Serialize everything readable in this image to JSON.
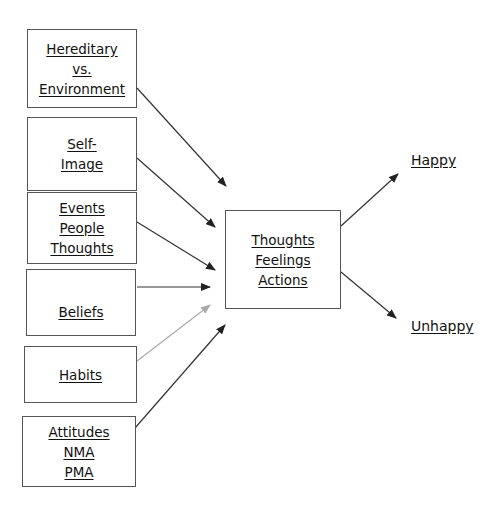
{
  "diagram": {
    "inputs": [
      {
        "id": "hereditary",
        "lines": [
          "Hereditary",
          "vs.",
          "Environment"
        ]
      },
      {
        "id": "self-image",
        "lines": [
          "Self-",
          "Image"
        ]
      },
      {
        "id": "events",
        "lines": [
          "Events",
          "People",
          "Thoughts"
        ]
      },
      {
        "id": "beliefs",
        "lines": [
          "Beliefs"
        ]
      },
      {
        "id": "habits",
        "lines": [
          "Habits"
        ]
      },
      {
        "id": "attitudes",
        "lines": [
          "Attitudes",
          "NMA",
          "PMA"
        ]
      }
    ],
    "center": {
      "lines": [
        "Thoughts",
        "Feelings",
        "Actions"
      ]
    },
    "outcomes": {
      "happy": "Happy",
      "unhappy": "Unhappy"
    },
    "colors": {
      "arrow": "#222222",
      "arrow_light": "#aaaaaa",
      "border": "#555555"
    }
  }
}
